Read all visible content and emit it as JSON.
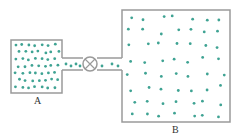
{
  "labels": {
    "a": "A",
    "b": "B"
  },
  "colors": {
    "wall": "#9a9a9a",
    "molecule": "#3fa393"
  },
  "container_a": {
    "x": 11,
    "y": 40,
    "w": 51,
    "h": 53
  },
  "container_b": {
    "x": 122,
    "y": 10,
    "w": 108,
    "h": 112
  },
  "valve": {
    "cx": 90,
    "cy": 64,
    "r": 7
  }
}
